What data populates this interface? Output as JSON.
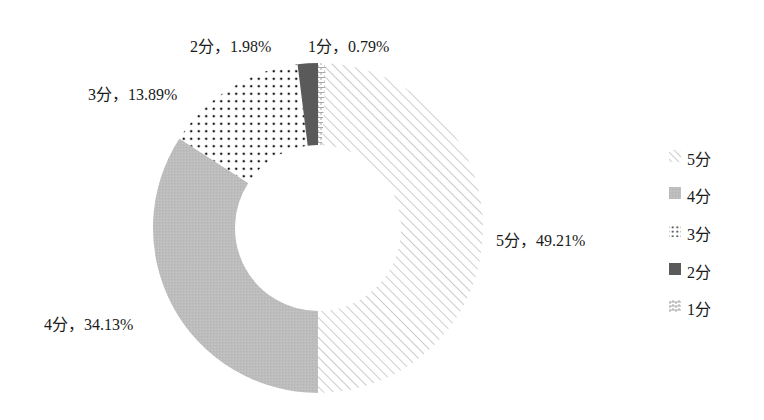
{
  "chart_data": {
    "type": "pie",
    "variant": "donut",
    "title": "",
    "categories": [
      "5分",
      "4分",
      "3分",
      "2分",
      "1分"
    ],
    "values": [
      49.21,
      34.13,
      13.89,
      1.98,
      0.79
    ],
    "unit": "%",
    "start_angle_deg": 0,
    "direction": "clockwise",
    "draw_order": [
      "1分",
      "5分",
      "4分",
      "3分",
      "2分"
    ],
    "data_labels": [
      {
        "category": "5分",
        "text": "5分，49.21%"
      },
      {
        "category": "4分",
        "text": "4分，34.13%"
      },
      {
        "category": "3分",
        "text": "3分，13.89%"
      },
      {
        "category": "2分",
        "text": "2分，1.98%"
      },
      {
        "category": "1分",
        "text": "1分，0.79%"
      }
    ],
    "legend": {
      "position": "right",
      "entries": [
        {
          "label": "5分",
          "pattern": "diagonal-hatch"
        },
        {
          "label": "4分",
          "pattern": "solid-light-gray"
        },
        {
          "label": "3分",
          "pattern": "dots"
        },
        {
          "label": "2分",
          "pattern": "solid-dark-gray"
        },
        {
          "label": "1分",
          "pattern": "brick"
        }
      ]
    },
    "colors": {
      "5分": "#9a9a9a",
      "4分": "#bdbdbd",
      "3分": "#111111",
      "2分": "#5a5a5a",
      "1分": "#a8a8a8"
    },
    "grid": false
  },
  "labels": {
    "five": "5分，49.21%",
    "four": "4分，34.13%",
    "three": "3分，13.89%",
    "two": "2分，1.98%",
    "one": "1分，0.79%"
  },
  "legend": {
    "five": "5分",
    "four": "4分",
    "three": "3分",
    "two": "2分",
    "one": "1分"
  }
}
